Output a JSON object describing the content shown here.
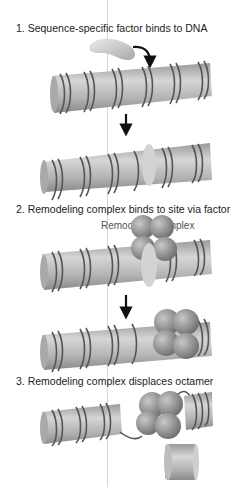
{
  "steps": [
    {
      "label": "1. Sequence-specific factor binds to DNA"
    },
    {
      "label": "2. Remodeling complex binds to site via factor",
      "annotation": "Remodeling complex"
    },
    {
      "label": "3. Remodeling complex displaces octamer"
    }
  ],
  "colors": {
    "background": "#ffffff",
    "cylinder": "#b8b8b8",
    "dna": "#555555",
    "factor": "#cfcfcf",
    "complex": "#8f8f8f",
    "arrow": "#111111"
  }
}
